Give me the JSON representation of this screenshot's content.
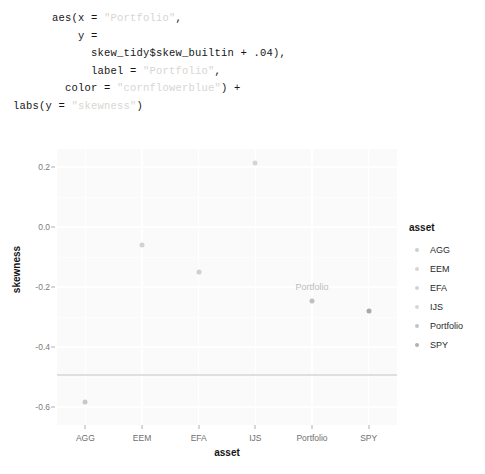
{
  "code": {
    "language": "r",
    "lines": [
      [
        {
          "t": "        aes(x = ",
          "c": "plain"
        },
        {
          "t": "\"Portfolio\"",
          "c": "str"
        },
        {
          "t": ",",
          "c": "plain"
        }
      ],
      [
        {
          "t": "            y =",
          "c": "plain"
        }
      ],
      [
        {
          "t": "              skew_tidy$skew_builtin + .04),",
          "c": "plain"
        }
      ],
      [
        {
          "t": "              label = ",
          "c": "plain"
        },
        {
          "t": "\"Portfolio\"",
          "c": "str"
        },
        {
          "t": ",",
          "c": "plain"
        }
      ],
      [
        {
          "t": "          color = ",
          "c": "plain"
        },
        {
          "t": "\"cornflowerblue\"",
          "c": "str"
        },
        {
          "t": ") +",
          "c": "plain"
        }
      ],
      [
        {
          "t": "  labs(y = ",
          "c": "plain"
        },
        {
          "t": "\"skewness\"",
          "c": "str"
        },
        {
          "t": ")",
          "c": "plain"
        }
      ]
    ],
    "string_color": "#d8d6d2",
    "plain_color": "#161616"
  },
  "chart_data": {
    "type": "scatter",
    "title": "",
    "xlabel": "asset",
    "ylabel": "skewness",
    "categories": [
      "AGG",
      "EEM",
      "EFA",
      "IJS",
      "Portfolio",
      "SPY"
    ],
    "values": [
      -0.584,
      -0.06,
      -0.15,
      0.215,
      -0.245,
      -0.28
    ],
    "point_labels": [
      null,
      null,
      null,
      null,
      "Portfolio",
      null
    ],
    "ylim": [
      -0.66,
      0.26
    ],
    "yticks": [
      0.2,
      0.0,
      -0.2,
      -0.4,
      -0.6
    ],
    "ytick_labels": [
      "0.2",
      "0.0",
      "-0.2",
      "-0.4",
      "-0.6"
    ],
    "grid": true,
    "legend_position": "right",
    "hline_y": -0.49,
    "series": [
      {
        "name": "asset",
        "categories": [
          "AGG",
          "EEM",
          "EFA",
          "IJS",
          "Portfolio",
          "SPY"
        ],
        "values": [
          -0.584,
          -0.06,
          -0.15,
          0.215,
          -0.245,
          -0.28
        ]
      }
    ],
    "point_colors": [
      "#c9c9c9",
      "#d2d2d2",
      "#cfcfcf",
      "#d5d5d5",
      "#c0c0c0",
      "#a9a9a9"
    ],
    "panel_background": "#fafafa",
    "grid_color": "#ffffff",
    "label_text_color": "#bcbcbc"
  },
  "legend": {
    "title": "asset",
    "items": [
      {
        "label": "AGG",
        "color": "#cfcfcf"
      },
      {
        "label": "EEM",
        "color": "#d6d6d6"
      },
      {
        "label": "EFA",
        "color": "#d4d4d4"
      },
      {
        "label": "IJS",
        "color": "#d8d8d8"
      },
      {
        "label": "Portfolio",
        "color": "#c4c4c4"
      },
      {
        "label": "SPY",
        "color": "#b2b2b2"
      }
    ]
  }
}
